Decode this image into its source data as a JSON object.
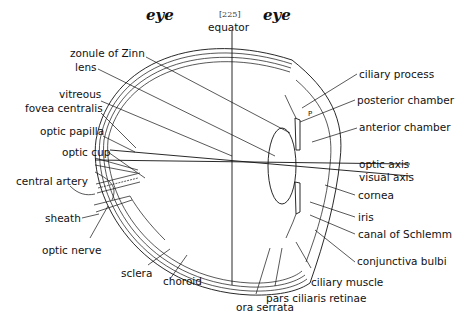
{
  "header": {
    "left_word": "eye",
    "page_number": "[225]",
    "right_word": "eye"
  },
  "diagram": {
    "labels_left": [
      "zonule of Zinn",
      "lens",
      "vitreous",
      "fovea centralis",
      "optic papilla",
      "optic cup",
      "central artery",
      "sheath",
      "optic nerve"
    ],
    "labels_top": [
      "equator"
    ],
    "labels_right": [
      "ciliary process",
      "posterior chamber",
      "anterior chamber",
      "optic axis",
      "visual axis",
      "cornea",
      "iris",
      "canal of Schlemm",
      "conjunctiva bulbi"
    ],
    "labels_bottom": [
      "sclera",
      "choroid",
      "ora serrata",
      "pars ciliaris retinae",
      "ciliary muscle"
    ],
    "inline_marks": [
      "P"
    ]
  }
}
